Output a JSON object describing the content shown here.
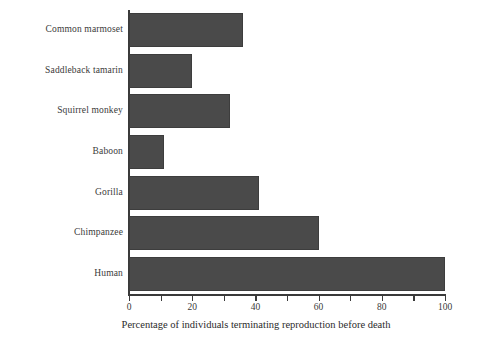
{
  "chart_data": {
    "type": "bar",
    "orientation": "horizontal",
    "title": "",
    "xlabel": "Percentage of individuals terminating reproduction before death",
    "ylabel": "",
    "categories": [
      "Common marmoset",
      "Saddleback tamarin",
      "Squirrel monkey",
      "Baboon",
      "Gorilla",
      "Chimpanzee",
      "Human"
    ],
    "values": [
      36,
      20,
      32,
      11,
      41,
      60,
      100
    ],
    "xlim": [
      0,
      100
    ],
    "xticks": [
      0,
      10,
      20,
      30,
      40,
      50,
      60,
      70,
      80,
      90,
      100
    ],
    "xtick_labels": [
      "0",
      "",
      "20",
      "",
      "40",
      "",
      "60",
      "",
      "80",
      "",
      "100"
    ],
    "grid": false,
    "legend": null,
    "bar_color": "#4a4a4a",
    "axis_color": "#3a3a3a",
    "background": "#ffffff"
  },
  "axis": {
    "tick_labels_visible": [
      "0",
      "20",
      "40",
      "60",
      "80",
      "100"
    ]
  }
}
